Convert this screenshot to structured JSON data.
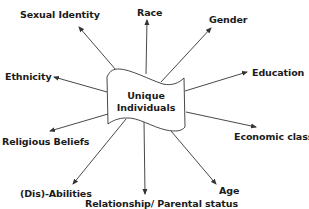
{
  "center": {
    "line1": "Unique",
    "line2": "Individuals"
  },
  "factors": [
    {
      "id": "sexual-identity",
      "label": "Sexual Identity"
    },
    {
      "id": "race",
      "label": "Race"
    },
    {
      "id": "gender",
      "label": "Gender"
    },
    {
      "id": "education",
      "label": "Education"
    },
    {
      "id": "ethnicity",
      "label": "Ethnicity"
    },
    {
      "id": "economic-class",
      "label": "Economic class"
    },
    {
      "id": "religious-beliefs",
      "label": "Religious Beliefs"
    },
    {
      "id": "dis-abilities",
      "label": "(Dis)-Abilities"
    },
    {
      "id": "relationship-parental-status",
      "label": "Relationship/ Parental status"
    },
    {
      "id": "age",
      "label": "Age"
    }
  ],
  "colors": {
    "stroke": "#333333",
    "text": "#1a1a1a",
    "background": "#ffffff"
  }
}
